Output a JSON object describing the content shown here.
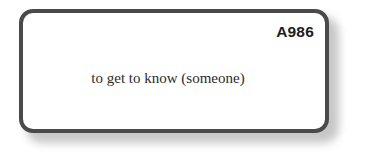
{
  "card": {
    "id_label": "A986",
    "term": "to get to know (someone)",
    "border_color": "#4a4a4a",
    "background_color": "#ffffff",
    "text_color": "#2b2b2b",
    "id_color": "#1c1c1c"
  },
  "page": {
    "background_color": "#ffffff"
  }
}
